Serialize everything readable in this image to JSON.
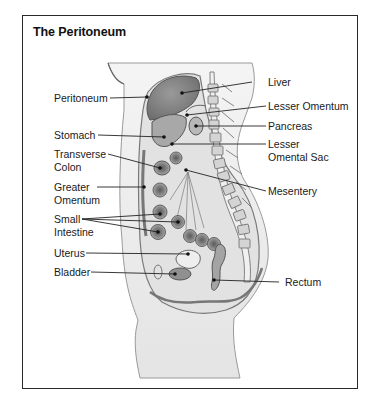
{
  "diagram": {
    "title": "The Peritoneum",
    "colors": {
      "frame": "#2a2a2a",
      "text": "#1a1a1a",
      "organ_fill": "#8a8a8a",
      "tissue_fill": "#d8d8d8",
      "skin_fill": "#ececec",
      "leader_line": "#222222"
    },
    "labels_left": [
      {
        "id": "peritoneum",
        "lines": [
          "Peritoneum"
        ]
      },
      {
        "id": "stomach",
        "lines": [
          "Stomach"
        ]
      },
      {
        "id": "transverse-colon",
        "lines": [
          "Transverse",
          "Colon"
        ]
      },
      {
        "id": "greater-omentum",
        "lines": [
          "Greater",
          "Omentum"
        ]
      },
      {
        "id": "small-intestine",
        "lines": [
          "Small",
          "Intestine"
        ]
      },
      {
        "id": "uterus",
        "lines": [
          "Uterus"
        ]
      },
      {
        "id": "bladder",
        "lines": [
          "Bladder"
        ]
      }
    ],
    "labels_right": [
      {
        "id": "liver",
        "lines": [
          "Liver"
        ]
      },
      {
        "id": "lesser-omentum",
        "lines": [
          "Lesser Omentum"
        ]
      },
      {
        "id": "pancreas",
        "lines": [
          "Pancreas"
        ]
      },
      {
        "id": "lesser-omental-sac",
        "lines": [
          "Lesser",
          "Omental Sac"
        ]
      },
      {
        "id": "mesentery",
        "lines": [
          "Mesentery"
        ]
      },
      {
        "id": "rectum",
        "lines": [
          "Rectum"
        ]
      }
    ]
  }
}
